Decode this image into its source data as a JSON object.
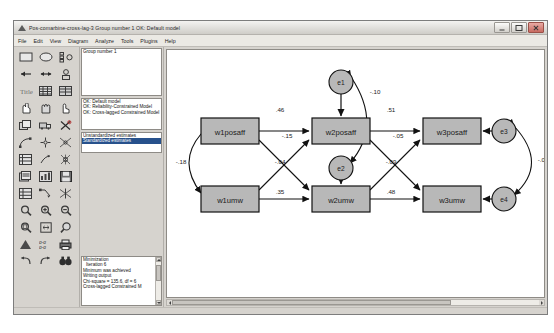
{
  "window": {
    "title": "Pos-comarbine-cross-lag-3  Group number 1  OK: Default model",
    "minimize_label": "Minimize",
    "maximize_label": "Maximize",
    "close_label": "Close"
  },
  "menu": {
    "items": [
      {
        "label": "File"
      },
      {
        "label": "Edit"
      },
      {
        "label": "View"
      },
      {
        "label": "Diagram"
      },
      {
        "label": "Analyze"
      },
      {
        "label": "Tools"
      },
      {
        "label": "Plugins"
      },
      {
        "label": "Help"
      }
    ]
  },
  "groups_panel": {
    "rows": [
      "Group number 1"
    ]
  },
  "models_panel": {
    "rows": [
      {
        "label": "OK: Default model",
        "selected": false
      },
      {
        "label": "OK: Reliability-Constrained Model",
        "selected": false
      },
      {
        "label": "OK: Cross-lagged Constrained Model",
        "selected": false
      }
    ]
  },
  "estimates_panel": {
    "rows": [
      {
        "label": "Unstandardized estimates",
        "selected": false
      },
      {
        "label": "Standardized estimates",
        "selected": true
      }
    ]
  },
  "output_panel": {
    "rows": [
      "Minimization",
      "Iteration 6",
      "Minimum was achieved",
      "Writing output",
      "Chi-square = 135.6, df = 6",
      "Cross-lagged Constrained M"
    ]
  },
  "palette": {
    "tools": [
      {
        "name": "draw-observed-variable",
        "icon": "rectangle"
      },
      {
        "name": "draw-unobserved-variable",
        "icon": "ellipse"
      },
      {
        "name": "draw-latent-with-indicators",
        "icon": "indicators"
      },
      {
        "name": "draw-path-single-arrow",
        "icon": "arrow-left"
      },
      {
        "name": "draw-covariance-double-arrow",
        "icon": "arrow-double"
      },
      {
        "name": "add-unique-variable",
        "icon": "error-term"
      },
      {
        "name": "figure-caption",
        "icon": "title-text"
      },
      {
        "name": "list-variables-in-dataset",
        "icon": "data-list"
      },
      {
        "name": "list-variables-in-model",
        "icon": "model-list"
      },
      {
        "name": "select-one-object",
        "icon": "hand-point"
      },
      {
        "name": "select-all-objects",
        "icon": "hand-all"
      },
      {
        "name": "deselect-all-objects",
        "icon": "hand-none"
      },
      {
        "name": "duplicate-objects",
        "icon": "copy"
      },
      {
        "name": "move-objects",
        "icon": "move-truck"
      },
      {
        "name": "erase-objects",
        "icon": "eraser-x"
      },
      {
        "name": "change-shape-of-objects",
        "icon": "resize"
      },
      {
        "name": "rotate-indicators",
        "icon": "rotate"
      },
      {
        "name": "reflect-indicators",
        "icon": "reflect"
      },
      {
        "name": "move-parameter-values",
        "icon": "param-move"
      },
      {
        "name": "scroll-the-path-diagram",
        "icon": "scroll-hand"
      },
      {
        "name": "touch-up-a-variable",
        "icon": "touchup-pen"
      },
      {
        "name": "select-data-files",
        "icon": "data-files"
      },
      {
        "name": "analysis-properties",
        "icon": "analysis-props"
      },
      {
        "name": "save-current-path-diagram",
        "icon": "save-disk"
      },
      {
        "name": "object-properties",
        "icon": "object-props"
      },
      {
        "name": "drag-properties",
        "icon": "drag-props"
      },
      {
        "name": "preserve-symmetries",
        "icon": "symmetry"
      },
      {
        "name": "zoom-in-region",
        "icon": "zoom-region"
      },
      {
        "name": "zoom-in",
        "icon": "zoom-plus"
      },
      {
        "name": "zoom-out",
        "icon": "zoom-minus"
      },
      {
        "name": "zoom-page",
        "icon": "zoom-page"
      },
      {
        "name": "fit-to-page",
        "icon": "fit-page"
      },
      {
        "name": "loupe-magnifier",
        "icon": "loupe"
      },
      {
        "name": "bayesian-estimation",
        "icon": "bayes"
      },
      {
        "name": "multiple-group-analysis",
        "icon": "multigroup"
      },
      {
        "name": "print-path-diagram",
        "icon": "printer"
      },
      {
        "name": "undo",
        "icon": "undo"
      },
      {
        "name": "redo",
        "icon": "redo"
      },
      {
        "name": "specification-search",
        "icon": "binoculars"
      }
    ]
  },
  "diagram": {
    "nodes": [
      {
        "id": "w1posaff",
        "label": "w1posaff",
        "shape": "rect",
        "x": 34,
        "y": 68,
        "w": 58,
        "h": 26
      },
      {
        "id": "w2posaff",
        "label": "w2posaff",
        "shape": "rect",
        "x": 145,
        "y": 68,
        "w": 58,
        "h": 26
      },
      {
        "id": "w3posaff",
        "label": "w3posaff",
        "shape": "rect",
        "x": 256,
        "y": 68,
        "w": 58,
        "h": 26
      },
      {
        "id": "w1umw",
        "label": "w1umw",
        "shape": "rect",
        "x": 34,
        "y": 136,
        "w": 58,
        "h": 26
      },
      {
        "id": "w2umw",
        "label": "w2umw",
        "shape": "rect",
        "x": 145,
        "y": 136,
        "w": 58,
        "h": 26
      },
      {
        "id": "w3umw",
        "label": "w3umw",
        "shape": "rect",
        "x": 256,
        "y": 136,
        "w": 58,
        "h": 26
      }
    ],
    "errors": [
      {
        "id": "e1",
        "label": "e1",
        "cx": 174,
        "cy": 32,
        "r": 12
      },
      {
        "id": "e2",
        "label": "e2",
        "cx": 174,
        "cy": 118,
        "r": 12
      },
      {
        "id": "e3",
        "label": "e3",
        "cx": 337,
        "cy": 81,
        "r": 12
      },
      {
        "id": "e4",
        "label": "e4",
        "cx": 337,
        "cy": 149,
        "r": 12
      }
    ],
    "path_labels": [
      {
        "id": "p-w1posaff-w2posaff",
        "value": ".46",
        "x": 113,
        "y": 62
      },
      {
        "id": "p-w1posaff-w2umw",
        "value": "-.15",
        "x": 118,
        "y": 88
      },
      {
        "id": "p-w1umw-w2posaff",
        "value": "-.04",
        "x": 113,
        "y": 112
      },
      {
        "id": "p-w1umw-w2umw",
        "value": ".35",
        "x": 113,
        "y": 130
      },
      {
        "id": "cov-w1posaff-w1umw",
        "value": "-.18",
        "x": 12,
        "y": 112
      },
      {
        "id": "p-w2posaff-w3posaff",
        "value": ".51",
        "x": 224,
        "y": 62
      },
      {
        "id": "p-w2posaff-w3umw",
        "value": "-.05",
        "x": 228,
        "y": 88
      },
      {
        "id": "p-w2umw-w3posaff",
        "value": "-.09",
        "x": 224,
        "y": 112
      },
      {
        "id": "p-w2umw-w3umw",
        "value": ".48",
        "x": 224,
        "y": 130
      },
      {
        "id": "cov-e1-e2",
        "value": "-.10",
        "x": 206,
        "y": 44
      },
      {
        "id": "cov-e3-e4",
        "value": "-.05",
        "x": 374,
        "y": 110
      }
    ],
    "node_fill": "#b8b8b8",
    "node_stroke": "#1a1a1a",
    "error_fill": "#b8b8b8"
  }
}
